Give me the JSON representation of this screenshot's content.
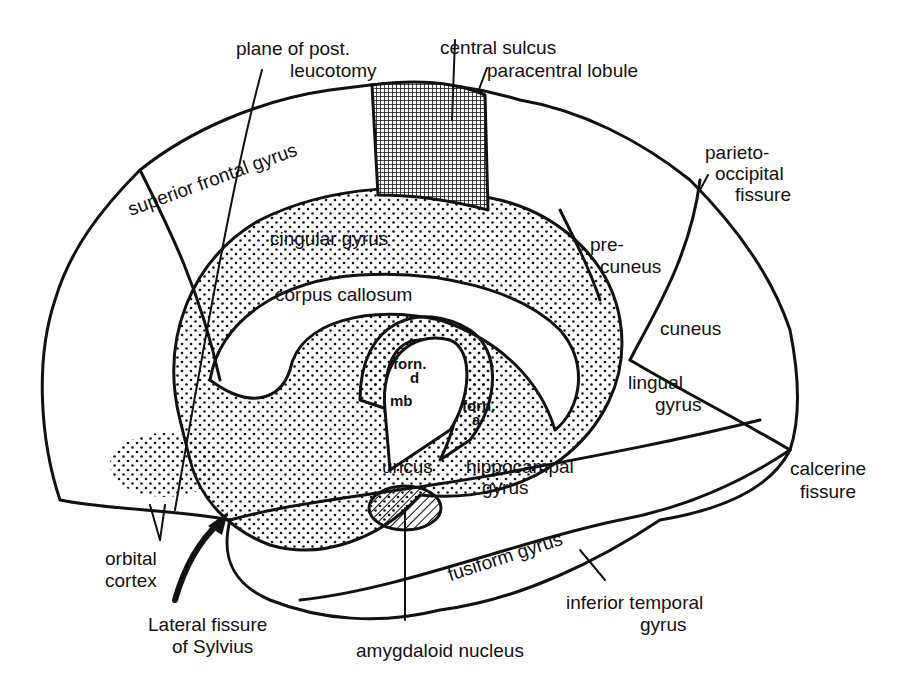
{
  "diagram": {
    "colors": {
      "ink": "#111111",
      "background": "#ffffff",
      "stipple": "#111111"
    },
    "labels": {
      "plane_of_post": "plane of post.",
      "leucotomy": "leucotomy",
      "central_sulcus": "central sulcus",
      "paracentral_lobule": "paracentral lobule",
      "parieto": "parieto-",
      "occipital_fissure_1": "occipital",
      "occipital_fissure_2": "fissure",
      "superior_frontal_gyrus": "superior frontal gyrus",
      "cingular_gyrus": "cingular gyrus",
      "pre": "pre-",
      "cuneus_pre": "cuneus",
      "corpus_callosum": "corpus callosum",
      "cuneus": "cuneus",
      "forn_d_1": "forn.",
      "forn_d_2": "d",
      "mb": "mb",
      "forn_a_1": "forn.",
      "forn_a_2": "a",
      "lingual_1": "lingual",
      "lingual_2": "gyrus",
      "uncus": "uncus",
      "hippocampal_1": "hippocampal",
      "hippocampal_2": "gyrus",
      "calcerine_1": "calcerine",
      "calcerine_2": "fissure",
      "fusiform_gyrus": "fusiform gyrus",
      "orbital_1": "orbital",
      "orbital_2": "cortex",
      "lateral_1": "Lateral fissure",
      "lateral_2": "of Sylvius",
      "inferior_temporal_1": "inferior temporal",
      "inferior_temporal_2": "gyrus",
      "amygdaloid_nucleus": "amygdaloid nucleus"
    }
  }
}
